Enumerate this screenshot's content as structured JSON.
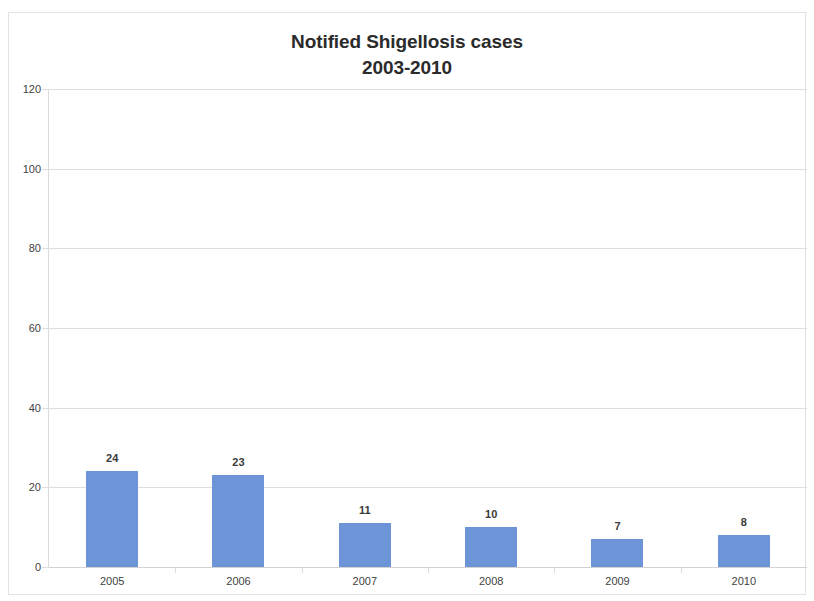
{
  "chart_data": {
    "type": "bar",
    "title": "Notified Shigellosis cases\n2003-2010",
    "title_line1": "Notified Shigellosis cases",
    "title_line2": "2003-2010",
    "categories": [
      "2005",
      "2006",
      "2007",
      "2008",
      "2009",
      "2010"
    ],
    "values": [
      24,
      23,
      11,
      10,
      7,
      8
    ],
    "data_labels": [
      "24",
      "23",
      "11",
      "10",
      "7",
      "8"
    ],
    "xlabel": "",
    "ylabel": "",
    "ylim": [
      0,
      120
    ],
    "y_ticks": [
      0,
      20,
      40,
      60,
      80,
      100,
      120
    ],
    "y_tick_labels": [
      "0",
      "20",
      "40",
      "60",
      "80",
      "100",
      "120"
    ],
    "grid": true,
    "grid_axis": "y",
    "legend": false,
    "legend_position": "none",
    "series": [
      {
        "name": "Notified Shigellosis cases",
        "values": [
          24,
          23,
          11,
          10,
          7,
          8
        ],
        "color": "#6c94d6"
      }
    ],
    "colors": {
      "bar": "#6c94d6",
      "gridline": "#dedede",
      "axis": "#dcdcdc",
      "frame_border": "#e2e2e2",
      "title_text": "#2b2b2b",
      "tick_text": "#3f3f3f",
      "data_label_text": "#3a3a3a",
      "plot_background": "#ffffff"
    }
  }
}
